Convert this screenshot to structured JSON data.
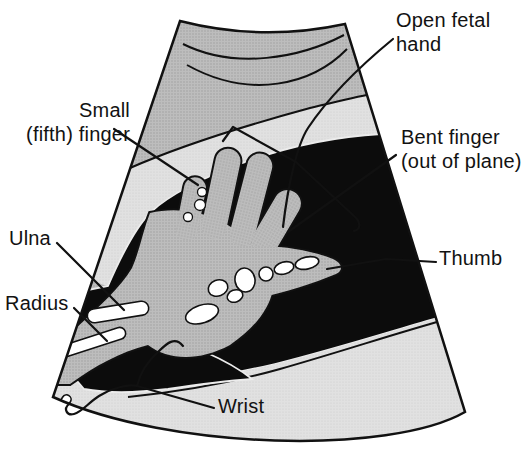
{
  "figure": {
    "alt": "Line-art schematic of an obstetric ultrasound sector scan showing an open fetal hand with forearm bones",
    "labels": {
      "open_fetal_hand": {
        "line1": "Open fetal",
        "line2": "hand"
      },
      "small_fifth_finger": {
        "line1": "Small",
        "line2": "(fifth) finger"
      },
      "bent_finger": {
        "line1": "Bent finger",
        "line2": "(out of plane)"
      },
      "ulna": {
        "text": "Ulna"
      },
      "radius": {
        "text": "Radius"
      },
      "thumb": {
        "text": "Thumb"
      },
      "wrist": {
        "text": "Wrist"
      }
    },
    "colors": {
      "ink": "#111111",
      "fluid_black": "#0c0c0c",
      "tissue_gray": "#b9b9b9",
      "light_gray": "#dcdcdc",
      "bone_white": "#ffffff",
      "page_background": "#ffffff"
    }
  }
}
